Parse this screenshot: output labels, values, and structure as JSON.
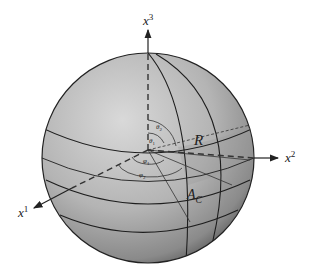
{
  "figure": {
    "type": "sphere with coordinate axes"
  },
  "axes": {
    "x3": {
      "base": "x",
      "sup": "3"
    },
    "x2": {
      "base": "x",
      "sup": "2"
    },
    "x1": {
      "base": "x",
      "sup": "1"
    }
  },
  "labels": {
    "radius": "R",
    "area": {
      "base": "A",
      "sub": "C"
    },
    "theta1": {
      "base": "θ",
      "sub": "1"
    },
    "theta2": {
      "base": "θ",
      "sub": "2"
    },
    "phi1": {
      "base": "φ",
      "sub": "1"
    },
    "phi2": {
      "base": "φ",
      "sub": "2"
    }
  },
  "colors": {
    "sphere_light": "#d6d6d6",
    "sphere_mid": "#a8a8a8",
    "sphere_dark": "#5a5a5a",
    "line": "#1e1e1e",
    "region": "#8c8c8c"
  }
}
